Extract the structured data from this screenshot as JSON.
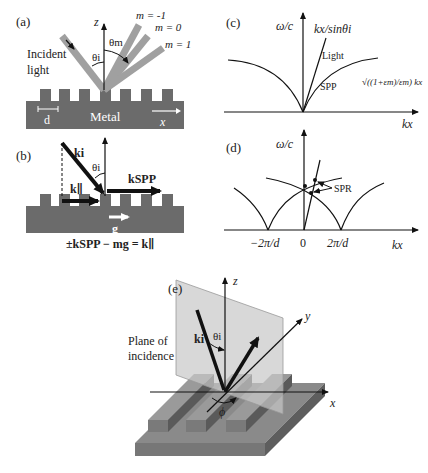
{
  "panel_a": {
    "label": "(a)",
    "axis_z": "z",
    "axis_x": "x",
    "incident_line1": "Incident",
    "incident_line2": "light",
    "theta_i": "θi",
    "theta_m": "θm",
    "orders": [
      "m = -1",
      "m = 0",
      "m = 1"
    ],
    "period": "d",
    "material": "Metal"
  },
  "panel_b": {
    "label": "(b)",
    "k_i": "ki",
    "theta_i": "θi",
    "k_par": "k∥",
    "k_spp": "kSPP",
    "g": "g",
    "equation": "±kSPP − mg = k∥"
  },
  "panel_c": {
    "label": "(c)",
    "ylabel": "ω/c",
    "light_line_label": "kx/sinθi",
    "light": "Light",
    "spp": "SPP",
    "spp_formula": "√((1+εm)/εm) kx",
    "xlabel": "kx"
  },
  "panel_d": {
    "label": "(d)",
    "ylabel": "ω/c",
    "spr": "SPR",
    "ticks": [
      "−2π/d",
      "0",
      "2π/d"
    ],
    "xlabel": "kx"
  },
  "panel_e": {
    "label": "(e)",
    "axis_z": "z",
    "axis_y": "y",
    "axis_x": "x",
    "plane_line1": "Plane of",
    "plane_line2": "incidence",
    "k_i": "ki",
    "theta_i": "θi",
    "phi": "ϕ"
  },
  "colors": {
    "metal": "#6b6b6b",
    "beam": "#a0a0a0",
    "plane": "#c8c8c8",
    "ink": "#111111"
  }
}
